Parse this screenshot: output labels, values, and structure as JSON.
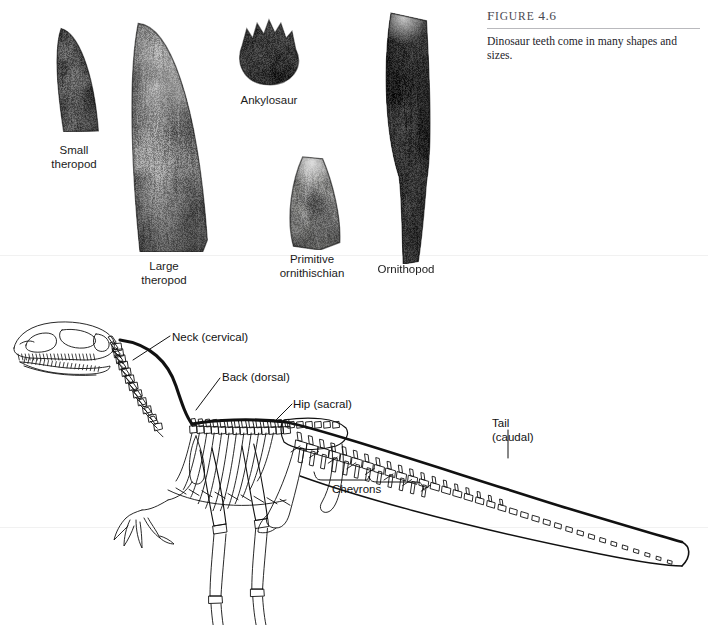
{
  "figure": {
    "number_prefix": "F",
    "number_rest": "IGURE",
    "number_value": "4.6",
    "number_full": "FIGURE 4.6",
    "caption": "Dinosaur teeth come in many shapes and sizes."
  },
  "teeth": [
    {
      "id": "small-theropod",
      "label_line1": "Small",
      "label_line2": "theropod",
      "tone": "dark-mottled",
      "shape": "curved-blade"
    },
    {
      "id": "large-theropod",
      "label_line1": "Large",
      "label_line2": "theropod",
      "tone": "light-mottled",
      "shape": "broad-curved-blade"
    },
    {
      "id": "ankylosaur",
      "label_line1": "Ankylosaur",
      "label_line2": "",
      "tone": "dark-solid",
      "shape": "leaf-crown"
    },
    {
      "id": "primitive-ornithischian",
      "label_line1": "Primitive",
      "label_line2": "ornithischian",
      "tone": "mid-grey",
      "shape": "triangular-crown"
    },
    {
      "id": "ornithopod",
      "label_line1": "Ornithopod",
      "label_line2": "",
      "tone": "very-dark",
      "shape": "long-column"
    }
  ],
  "skeleton": {
    "name": "theropod-dinosaur-skeleton",
    "annotations": [
      {
        "id": "neck",
        "text": "Neck (cervical)"
      },
      {
        "id": "back",
        "text": "Back (dorsal)"
      },
      {
        "id": "hip",
        "text": "Hip (sacral)"
      },
      {
        "id": "tail",
        "text": "Tail\n(caudal)"
      },
      {
        "id": "chevrons",
        "text": "Chevrons"
      }
    ]
  },
  "colors": {
    "page_background": "#ffffff",
    "text": "#111111",
    "caption_rule": "#b9b9bd",
    "page_rule": "#f1f1f1",
    "fig_number": "#4a4a52"
  }
}
